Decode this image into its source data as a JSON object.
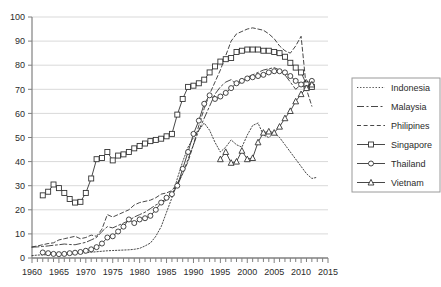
{
  "chart_data": {
    "type": "line",
    "title": "",
    "xlabel": "",
    "ylabel": "",
    "xlim": [
      1960,
      2015
    ],
    "ylim": [
      0,
      100
    ],
    "grid": true,
    "grid_axis": "y",
    "legend_position": "right",
    "x_tick_labels": [
      "1960",
      "1965",
      "1970",
      "1975",
      "1980",
      "1985",
      "1990",
      "1995",
      "2000",
      "2005",
      "2010",
      "2015"
    ],
    "x_tick_values": [
      1960,
      1965,
      1970,
      1975,
      1980,
      1985,
      1990,
      1995,
      2000,
      2005,
      2010,
      2015
    ],
    "x_minor_tick_step": 1,
    "y_tick_labels": [
      "0",
      "10",
      "20",
      "30",
      "40",
      "50",
      "60",
      "70",
      "80",
      "90",
      "100"
    ],
    "y_tick_values": [
      0,
      10,
      20,
      30,
      40,
      50,
      60,
      70,
      80,
      90,
      100
    ],
    "series": [
      {
        "name": "Indonesia",
        "style": "dotted",
        "marker": "none",
        "color": "#000000",
        "x": [
          1960,
          1961,
          1962,
          1963,
          1964,
          1965,
          1966,
          1967,
          1968,
          1969,
          1970,
          1971,
          1972,
          1973,
          1974,
          1975,
          1976,
          1977,
          1978,
          1979,
          1980,
          1981,
          1982,
          1983,
          1984,
          1985,
          1986,
          1987,
          1988,
          1989,
          1990,
          1991,
          1992,
          1993,
          1994,
          1995,
          1996,
          1997,
          1998,
          1999,
          2000,
          2001,
          2002,
          2003,
          2004,
          2005,
          2006,
          2007,
          2008,
          2009,
          2010,
          2011,
          2012,
          2013
        ],
        "values": [
          1.0,
          1.2,
          1.3,
          1.4,
          1.5,
          1.5,
          1.6,
          1.7,
          1.8,
          2.0,
          2.2,
          2.4,
          2.6,
          2.8,
          3.0,
          3.1,
          3.2,
          3.3,
          3.4,
          3.6,
          4.0,
          5.0,
          6.2,
          9.0,
          13.0,
          19.0,
          25.0,
          33.0,
          40.0,
          46.0,
          50.0,
          53.0,
          56.0,
          53.0,
          48.0,
          44.0,
          46.0,
          49.0,
          47.0,
          46.0,
          51.0,
          55.0,
          56.0,
          51.0,
          50.0,
          52.0,
          50.0,
          47.0,
          44.0,
          41.0,
          38.0,
          35.0,
          33.0,
          33.5
        ]
      },
      {
        "name": "Malaysia",
        "style": "dashdot",
        "marker": "none",
        "color": "#000000",
        "x": [
          1960,
          1961,
          1962,
          1963,
          1964,
          1965,
          1966,
          1967,
          1968,
          1969,
          1970,
          1971,
          1972,
          1973,
          1974,
          1975,
          1976,
          1977,
          1978,
          1979,
          1980,
          1981,
          1982,
          1983,
          1984,
          1985,
          1986,
          1987,
          1988,
          1989,
          1990,
          1991,
          1992,
          1993,
          1994,
          1995,
          1996,
          1997,
          1998,
          1999,
          2000,
          2001,
          2002,
          2003,
          2004,
          2005,
          2006,
          2007,
          2008,
          2009,
          2010,
          2011,
          2012
        ],
        "values": [
          4.5,
          4.6,
          4.8,
          5.0,
          5.3,
          5.5,
          5.8,
          5.6,
          5.5,
          6.0,
          6.5,
          7.5,
          8.5,
          11.0,
          13.0,
          12.5,
          13.5,
          14.5,
          15.5,
          17.0,
          18.0,
          19.0,
          20.5,
          22.0,
          23.0,
          24.0,
          26.0,
          30.0,
          35.0,
          41.0,
          47.0,
          53.0,
          58.0,
          63.0,
          68.0,
          71.0,
          73.0,
          74.0,
          72.0,
          73.0,
          75.0,
          76.0,
          77.0,
          78.0,
          78.5,
          79.0,
          78.0,
          76.0,
          73.0,
          70.0,
          72.0,
          74.0,
          70.0
        ]
      },
      {
        "name": "Philipines",
        "style": "dashed",
        "marker": "none",
        "color": "#000000",
        "x": [
          1960,
          1961,
          1962,
          1963,
          1964,
          1965,
          1966,
          1967,
          1968,
          1969,
          1970,
          1971,
          1972,
          1973,
          1974,
          1975,
          1976,
          1977,
          1978,
          1979,
          1980,
          1981,
          1982,
          1983,
          1984,
          1985,
          1986,
          1987,
          1988,
          1989,
          1990,
          1991,
          1992,
          1993,
          1994,
          1995,
          1996,
          1997,
          1998,
          1999,
          2000,
          2001,
          2002,
          2003,
          2004,
          2005,
          2006,
          2007,
          2008,
          2009,
          2010,
          2011,
          2012
        ],
        "values": [
          4.6,
          5.0,
          5.5,
          6.0,
          6.3,
          7.5,
          8.0,
          8.5,
          9.0,
          8.0,
          8.5,
          9.5,
          9.0,
          12.0,
          18.0,
          17.0,
          18.0,
          19.0,
          20.0,
          22.0,
          23.0,
          23.5,
          24.0,
          25.0,
          26.5,
          27.0,
          28.0,
          31.0,
          35.0,
          40.0,
          47.0,
          55.0,
          62.0,
          68.0,
          73.0,
          78.0,
          84.0,
          90.0,
          93.0,
          94.0,
          95.0,
          95.5,
          95.0,
          94.5,
          93.0,
          91.0,
          88.0,
          86.0,
          85.0,
          88.0,
          92.0,
          70.0,
          63.0
        ]
      },
      {
        "name": "Singapore",
        "style": "solid",
        "marker": "square",
        "color": "#000000",
        "x": [
          1962,
          1963,
          1964,
          1965,
          1966,
          1967,
          1968,
          1969,
          1970,
          1971,
          1972,
          1973,
          1974,
          1975,
          1976,
          1977,
          1978,
          1979,
          1980,
          1981,
          1982,
          1983,
          1984,
          1985,
          1986,
          1987,
          1988,
          1989,
          1990,
          1991,
          1992,
          1993,
          1994,
          1995,
          1996,
          1997,
          1998,
          1999,
          2000,
          2001,
          2002,
          2003,
          2004,
          2005,
          2006,
          2007,
          2008,
          2009,
          2010,
          2011,
          2012
        ],
        "values": [
          26.0,
          27.5,
          30.5,
          29.0,
          27.0,
          24.5,
          23.0,
          23.3,
          27.0,
          33.0,
          41.0,
          41.5,
          44.0,
          40.5,
          42.5,
          43.0,
          44.0,
          45.5,
          46.5,
          47.5,
          48.5,
          49.0,
          49.5,
          50.5,
          51.5,
          59.5,
          66.0,
          71.0,
          71.5,
          72.5,
          74.0,
          77.0,
          79.5,
          81.5,
          82.5,
          83.0,
          85.5,
          86.0,
          86.5,
          86.5,
          86.5,
          86.0,
          86.0,
          85.5,
          85.0,
          83.5,
          81.0,
          79.0,
          77.0,
          72.0,
          71.0
        ]
      },
      {
        "name": "Thailand",
        "style": "solid",
        "marker": "circle",
        "color": "#000000",
        "x": [
          1962,
          1963,
          1964,
          1965,
          1966,
          1967,
          1968,
          1969,
          1970,
          1971,
          1972,
          1973,
          1974,
          1975,
          1976,
          1977,
          1978,
          1979,
          1980,
          1981,
          1982,
          1983,
          1984,
          1985,
          1986,
          1987,
          1988,
          1989,
          1990,
          1991,
          1992,
          1993,
          1994,
          1995,
          1996,
          1997,
          1998,
          1999,
          2000,
          2001,
          2002,
          2003,
          2004,
          2005,
          2006,
          2007,
          2008,
          2009,
          2010,
          2011,
          2012
        ],
        "values": [
          2.3,
          2.0,
          1.7,
          1.6,
          1.7,
          2.0,
          2.2,
          2.5,
          3.0,
          3.6,
          4.5,
          6.0,
          8.5,
          9.0,
          11.0,
          13.0,
          16.0,
          14.5,
          16.0,
          16.5,
          17.5,
          20.0,
          23.0,
          25.0,
          26.5,
          30.0,
          37.0,
          44.0,
          51.5,
          57.0,
          64.0,
          67.5,
          66.0,
          67.0,
          68.5,
          70.5,
          72.5,
          73.5,
          74.5,
          75.0,
          75.5,
          76.0,
          77.0,
          77.5,
          77.5,
          77.0,
          75.5,
          73.5,
          72.0,
          70.5,
          73.5
        ]
      },
      {
        "name": "Vietnam",
        "style": "solid",
        "marker": "triangle",
        "color": "#000000",
        "x": [
          1995,
          1996,
          1997,
          1998,
          1999,
          2000,
          2001,
          2002,
          2003,
          2004,
          2005,
          2006,
          2007,
          2008,
          2009,
          2010,
          2011,
          2012
        ],
        "values": [
          41.0,
          44.0,
          39.5,
          40.0,
          44.5,
          41.0,
          41.5,
          48.0,
          52.0,
          52.5,
          52.0,
          54.5,
          58.0,
          61.0,
          65.0,
          68.0,
          70.5,
          72.0
        ]
      }
    ]
  },
  "legend": {
    "entries": [
      {
        "label": "Indonesia",
        "sample": "dotted-line-sample"
      },
      {
        "label": "Malaysia",
        "sample": "dashdot-line-sample"
      },
      {
        "label": "Philipines",
        "sample": "dashed-line-sample"
      },
      {
        "label": "Singapore",
        "sample": "square-marker-line-sample"
      },
      {
        "label": "Thailand",
        "sample": "circle-marker-line-sample"
      },
      {
        "label": "Vietnam",
        "sample": "triangle-marker-line-sample"
      }
    ]
  },
  "style": {
    "axis_color": "#808080",
    "grid_color": "#d9d9d9",
    "line_color": "#333333",
    "text_color": "#2b2b2b",
    "background": "#ffffff"
  }
}
